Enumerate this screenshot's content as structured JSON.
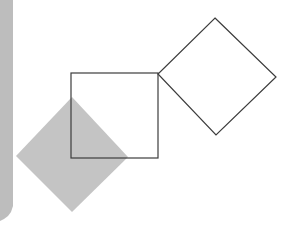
{
  "canvas": {
    "width": 292,
    "height": 232,
    "background_color": "#ffffff",
    "title": "Two squares and a shaded rotated square"
  },
  "shapes": {
    "left_edge_band": {
      "name": "scan-edge-band",
      "fill_color": "#bdbdbd",
      "description": "vertical light gray band along the left edge of the page scan",
      "points": "0,0 13,0 13,206 11,212 8,216 4,219 0,221",
      "stroke_color": "none",
      "stroke_width": 0
    },
    "shaded_diamond": {
      "name": "shaded-rotated-square",
      "fill_color": "#c4c4c4",
      "stroke_color": "none",
      "stroke_width": 0,
      "vertices": [
        {
          "label": "top",
          "x": 72,
          "y": 97
        },
        {
          "label": "right",
          "x": 128,
          "y": 157
        },
        {
          "label": "bottom",
          "x": 72,
          "y": 212
        },
        {
          "label": "left",
          "x": 16,
          "y": 156
        }
      ],
      "points": "72,97 128,157 72,212 16,156"
    },
    "axis_aligned_square": {
      "name": "outlined-square",
      "fill_color": "#ffffff",
      "stroke_color": "#3c3c3c",
      "stroke_width": 1.2,
      "x": 71,
      "y": 73,
      "width": 87,
      "height": 85,
      "vertices": [
        {
          "label": "top-left",
          "x": 71,
          "y": 73
        },
        {
          "label": "top-right",
          "x": 158,
          "y": 73
        },
        {
          "label": "bottom-right",
          "x": 158,
          "y": 158
        },
        {
          "label": "bottom-left",
          "x": 71,
          "y": 158
        }
      ]
    },
    "rotated_square": {
      "name": "outlined-rotated-square",
      "fill_color": "none",
      "stroke_color": "#3c3c3c",
      "stroke_width": 1.2,
      "vertices": [
        {
          "label": "top",
          "x": 215,
          "y": 18
        },
        {
          "label": "right",
          "x": 276,
          "y": 77
        },
        {
          "label": "bottom",
          "x": 216,
          "y": 135
        },
        {
          "label": "left",
          "x": 158,
          "y": 74
        }
      ],
      "points": "215,18 276,77 216,135 158,74"
    }
  }
}
